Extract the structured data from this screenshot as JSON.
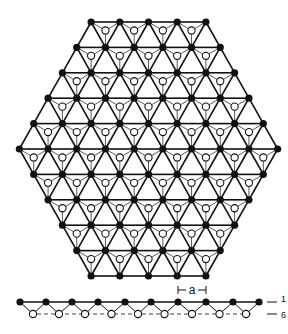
{
  "diagram": {
    "lattice": {
      "rows_point_counts": [
        5,
        6,
        7,
        8,
        9,
        10,
        9,
        8,
        7,
        6,
        5
      ],
      "top_y": 22,
      "row_spacing": 25.4,
      "col_spacing": 28.7,
      "center_x": 148.5,
      "filled_color": "#111111",
      "open_color": "#ffffff",
      "line_color": "#111111"
    },
    "side_view": {
      "top_y": 302,
      "bottom_y": 314,
      "filled_x": [
        20,
        46,
        72,
        98,
        125,
        151,
        178,
        206,
        233,
        259
      ],
      "label_a": "a",
      "label_top": "1",
      "label_bottom": "6"
    }
  }
}
